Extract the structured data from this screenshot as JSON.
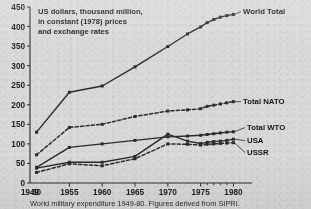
{
  "note": {
    "line1": "US dollars, thousand million,",
    "line2": "in constant (1978) prices",
    "line3": "and exchange rates"
  },
  "caption": "World military expenditure 1949-80. Figures derived from SIPRI.",
  "colors": {
    "ink": "#1d1d1d",
    "line": "#2b2b2b",
    "paper": "#d9d9d9"
  },
  "axes": {
    "y_ticks": [
      0,
      50,
      100,
      150,
      200,
      250,
      300,
      350,
      400,
      450
    ],
    "ylim": [
      0,
      450
    ],
    "xlim": [
      1949,
      1981
    ],
    "x_major_ticks": [
      1955,
      1960,
      1965,
      1970,
      1975,
      1980
    ],
    "x_minor_ticks": [
      1976,
      1977,
      1978,
      1979
    ],
    "x_tick_labels": [
      "1949",
      "50",
      "1955",
      "1960",
      "1965",
      "1970",
      "1975",
      "1980"
    ],
    "x_tick_label_years": [
      1949,
      1950,
      1955,
      1960,
      1965,
      1970,
      1975,
      1980
    ],
    "grid": false
  },
  "chart_data": {
    "type": "line",
    "title": "",
    "xlabel": "",
    "ylabel": "US dollars, thousand million, in constant (1978) prices and exchange rates",
    "ylim": [
      0,
      450
    ],
    "xlim": [
      1949,
      1981
    ],
    "legend_position": "right-inline-labels",
    "series": [
      {
        "name": "World Total",
        "style": "solid",
        "x": [
          1950,
          1955,
          1960,
          1965,
          1970,
          1973,
          1975,
          1976,
          1977,
          1978,
          1979,
          1980
        ],
        "values": [
          130,
          232,
          248,
          297,
          349,
          381,
          399,
          410,
          418,
          424,
          428,
          431
        ]
      },
      {
        "name": "Total NATO",
        "style": "dashed",
        "x": [
          1950,
          1955,
          1960,
          1965,
          1970,
          1973,
          1975,
          1976,
          1977,
          1978,
          1979,
          1980
        ],
        "values": [
          72,
          142,
          150,
          170,
          184,
          187,
          190,
          196,
          199,
          202,
          205,
          208
        ]
      },
      {
        "name": "Total WTO",
        "style": "solid",
        "x": [
          1950,
          1955,
          1960,
          1965,
          1970,
          1973,
          1975,
          1976,
          1977,
          1978,
          1979,
          1980
        ],
        "values": [
          40,
          91,
          100,
          109,
          118,
          120,
          122,
          124,
          126,
          128,
          130,
          131
        ]
      },
      {
        "name": "USA",
        "style": "solid",
        "x": [
          1950,
          1955,
          1960,
          1965,
          1970,
          1973,
          1975,
          1976,
          1977,
          1978,
          1979,
          1980
        ],
        "values": [
          38,
          53,
          53,
          68,
          125,
          107,
          101,
          104,
          106,
          107,
          109,
          112
        ]
      },
      {
        "name": "USSR",
        "style": "dashed",
        "x": [
          1950,
          1955,
          1960,
          1965,
          1970,
          1973,
          1975,
          1976,
          1977,
          1978,
          1979,
          1980
        ],
        "values": [
          27,
          49,
          44,
          62,
          100,
          99,
          97,
          99,
          100,
          101,
          102,
          103
        ]
      }
    ],
    "series_labels": [
      {
        "name": "World Total",
        "anchor_year": 1980,
        "anchor_value": 431,
        "text_x": 243,
        "text_y": 14
      },
      {
        "name": "Total NATO",
        "anchor_year": 1980,
        "anchor_value": 208,
        "text_x": 243,
        "text_y": 104
      },
      {
        "name": "Total WTO",
        "anchor_year": 1980,
        "anchor_value": 131,
        "text_x": 247,
        "text_y": 130
      },
      {
        "name": "USA",
        "anchor_year": 1980,
        "anchor_value": 112,
        "text_x": 247,
        "text_y": 143
      },
      {
        "name": "USSR",
        "anchor_year": 1980,
        "anchor_value": 103,
        "text_x": 247,
        "text_y": 155
      }
    ]
  }
}
